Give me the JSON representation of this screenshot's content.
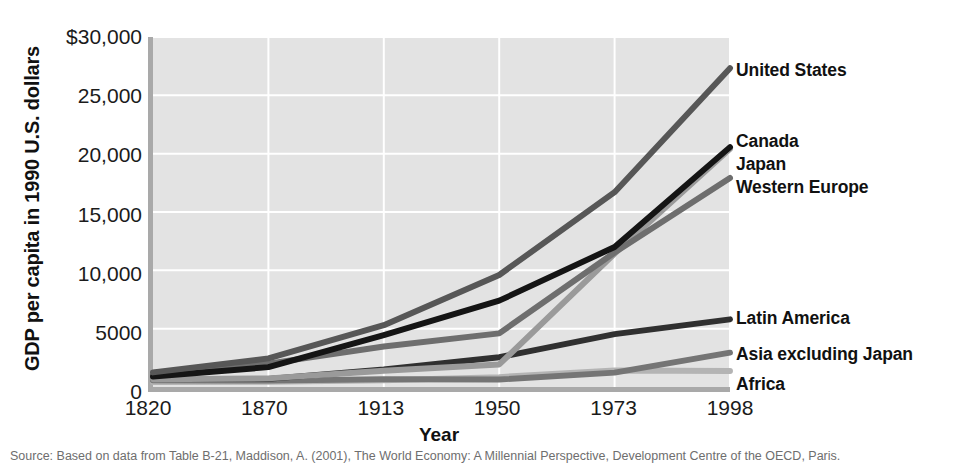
{
  "figure": {
    "y_axis_title": "GDP per capita in 1990 U.S. dollars",
    "x_axis_title": "Year",
    "source_caption": "Source: Based on data from Table B-21, Maddison, A. (2001), The World Economy: A Millennial Perspective, Development Centre of the OECD, Paris."
  },
  "colors": {
    "plot_background": "#e3e3e3",
    "gridline": "#ffffff",
    "axis_line": "#a9a9a9",
    "united_states": "#575757",
    "canada": "#151515",
    "japan": "#9a9a9a",
    "western_europe": "#6e6e6e",
    "latin_america": "#303030",
    "asia_excluding_japan": "#757575",
    "africa": "#b4b4b4"
  },
  "legend": {
    "items": [
      {
        "label": "United States",
        "y": 70,
        "color": "#575757"
      },
      {
        "label": "Canada",
        "y": 141,
        "color": "#151515"
      },
      {
        "label": "Japan",
        "y": 164,
        "color": "#9a9a9a"
      },
      {
        "label": "Western Europe",
        "y": 187,
        "color": "#6e6e6e"
      },
      {
        "label": "Latin America",
        "y": 318,
        "color": "#303030"
      },
      {
        "label": "Asia excluding Japan",
        "y": 354,
        "color": "#757575"
      },
      {
        "label": "Africa",
        "y": 384,
        "color": "#b4b4b4"
      }
    ]
  },
  "chart_data": {
    "type": "line",
    "title": "",
    "xlabel": "Year",
    "ylabel": "GDP per capita in 1990 U.S. dollars",
    "categories": [
      "1820",
      "1870",
      "1913",
      "1950",
      "1973",
      "1998"
    ],
    "x_tick_labels": [
      "1820",
      "1870",
      "1913",
      "1950",
      "1973",
      "1998"
    ],
    "y_tick_labels": [
      "$30,000",
      "25,000",
      "20,000",
      "15,000",
      "10,000",
      "5000",
      "0"
    ],
    "y_tick_values": [
      30000,
      25000,
      20000,
      15000,
      10000,
      5000,
      0
    ],
    "ylim": [
      0,
      30000
    ],
    "grid": true,
    "legend_position": "right-inline",
    "series": [
      {
        "name": "United States",
        "color": "#575757",
        "values": [
          1250,
          2450,
          5300,
          9600,
          16700,
          27330
        ]
      },
      {
        "name": "Canada",
        "color": "#151515",
        "values": [
          900,
          1700,
          4450,
          7400,
          12000,
          20560
        ]
      },
      {
        "name": "Japan",
        "color": "#9a9a9a",
        "values": [
          670,
          740,
          1390,
          1930,
          11440,
          20410
        ]
      },
      {
        "name": "Western Europe",
        "color": "#6e6e6e",
        "values": [
          1200,
          2000,
          3470,
          4600,
          11530,
          17920
        ]
      },
      {
        "name": "Latin America",
        "color": "#303030",
        "values": [
          690,
          700,
          1500,
          2550,
          4530,
          5800
        ]
      },
      {
        "name": "Asia excluding Japan",
        "color": "#757575",
        "values": [
          580,
          550,
          660,
          640,
          1230,
          2940
        ]
      },
      {
        "name": "Africa",
        "color": "#b4b4b4",
        "values": [
          420,
          440,
          585,
          850,
          1410,
          1370
        ]
      }
    ]
  }
}
